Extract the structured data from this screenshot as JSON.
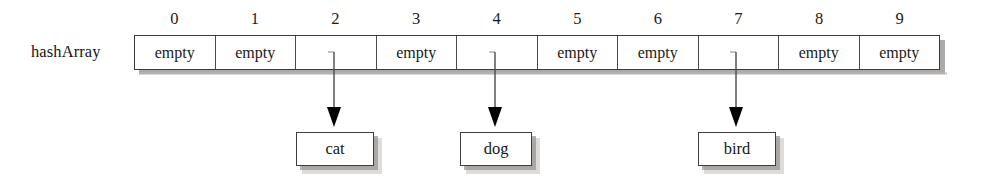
{
  "diagram": {
    "type": "hash-table-array",
    "array_label": "hashArray",
    "empty_label": "empty",
    "indices": [
      "0",
      "1",
      "2",
      "3",
      "4",
      "5",
      "6",
      "7",
      "8",
      "9"
    ],
    "cells": [
      {
        "index": "0",
        "text": "empty",
        "filled": false
      },
      {
        "index": "1",
        "text": "empty",
        "filled": false
      },
      {
        "index": "2",
        "text": "",
        "filled": true
      },
      {
        "index": "3",
        "text": "empty",
        "filled": false
      },
      {
        "index": "4",
        "text": "",
        "filled": true
      },
      {
        "index": "5",
        "text": "empty",
        "filled": false
      },
      {
        "index": "6",
        "text": "empty",
        "filled": false
      },
      {
        "index": "7",
        "text": "",
        "filled": true
      },
      {
        "index": "8",
        "text": "empty",
        "filled": false
      },
      {
        "index": "9",
        "text": "empty",
        "filled": false
      }
    ],
    "items": [
      {
        "label": "cat",
        "from_index": "2"
      },
      {
        "label": "dog",
        "from_index": "4"
      },
      {
        "label": "bird",
        "from_index": "7"
      }
    ],
    "colors": {
      "background": "#ffffff",
      "box_border": "#3a3a3a",
      "box_fill": "#ffffff",
      "shadow": "#8e8b88",
      "arrow": "#3c3c3c",
      "arrowhead": "#000000",
      "text": "#1a1a1a"
    }
  }
}
